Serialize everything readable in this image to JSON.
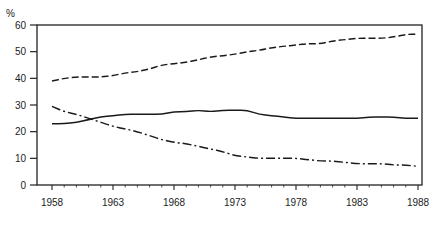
{
  "chart_data": {
    "type": "line",
    "title": "",
    "xlabel": "",
    "ylabel": "%",
    "ylim": [
      0,
      60
    ],
    "xlim": [
      1957,
      1988.3
    ],
    "yticks": [
      0,
      10,
      20,
      30,
      40,
      50,
      60
    ],
    "xticks": [
      1958,
      1963,
      1968,
      1973,
      1978,
      1983,
      1988
    ],
    "xtick_labels": [
      "1958",
      "1963",
      "1968",
      "1973",
      "1978",
      "1983",
      "1988"
    ],
    "ytick_labels": [
      "0",
      "10",
      "20",
      "30",
      "40",
      "50",
      "60"
    ],
    "grid": false,
    "legend": "none",
    "x": [
      1958,
      1959,
      1960,
      1961,
      1962,
      1963,
      1964,
      1965,
      1966,
      1967,
      1968,
      1969,
      1970,
      1971,
      1972,
      1973,
      1974,
      1975,
      1976,
      1977,
      1978,
      1979,
      1980,
      1981,
      1982,
      1983,
      1984,
      1985,
      1986,
      1987,
      1988
    ],
    "series": [
      {
        "name": "Series A (dashed)",
        "style": "dashed",
        "values": [
          39,
          40,
          40.5,
          40.5,
          40.5,
          41,
          42,
          42.5,
          43.5,
          45,
          45.5,
          46,
          47,
          48,
          48.5,
          49,
          50,
          50.5,
          51.5,
          52,
          52.5,
          53,
          53,
          54,
          54.5,
          55,
          55,
          55,
          55.5,
          56.5,
          56.5
        ]
      },
      {
        "name": "Series B (solid)",
        "style": "solid",
        "values": [
          23,
          23,
          23.5,
          24.5,
          25.5,
          26,
          26.5,
          26.5,
          26.5,
          26.5,
          27.5,
          27.5,
          28,
          27.5,
          28,
          28,
          28,
          26.5,
          26,
          25.5,
          25,
          25,
          25,
          25,
          25,
          25,
          25.5,
          25.5,
          25.5,
          25,
          25
        ]
      },
      {
        "name": "Series C (dash-dot)",
        "style": "dashdot",
        "values": [
          29.5,
          27.5,
          26.5,
          25,
          23.5,
          22,
          21,
          20,
          18.5,
          17,
          16,
          15.5,
          14.5,
          13.5,
          12.5,
          11,
          10.5,
          10,
          10,
          10,
          10,
          9.5,
          9,
          9,
          8.5,
          8,
          8,
          8,
          7.5,
          7.5,
          7
        ]
      }
    ]
  }
}
